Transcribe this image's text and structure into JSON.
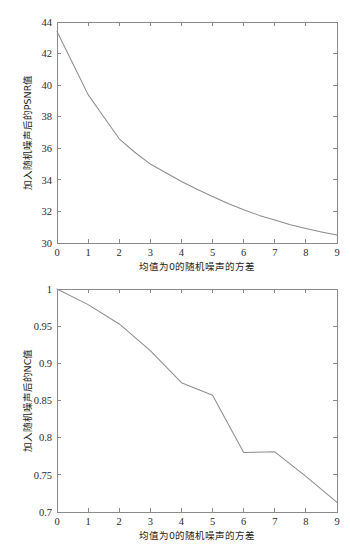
{
  "page": {
    "background_color": "#ffffff",
    "line_color": "#8d8d8d",
    "axis_color": "#8a8a8a",
    "text_color": "#2b2b2b"
  },
  "chart_data": [
    {
      "id": "psnr",
      "type": "line",
      "title": "",
      "xlabel": "均值为0的随机噪声的方差",
      "ylabel": "加入随机噪声后的PSNR值",
      "xlim": [
        0,
        9
      ],
      "ylim": [
        30,
        44
      ],
      "xticks": [
        0,
        1,
        2,
        3,
        4,
        5,
        6,
        7,
        8,
        9
      ],
      "xticklabels": [
        "0",
        "1",
        "2",
        "3",
        "4",
        "5",
        "6",
        "7",
        "8",
        "9"
      ],
      "yticks": [
        30,
        32,
        34,
        36,
        38,
        40,
        42,
        44
      ],
      "yticklabels": [
        "30",
        "32",
        "34",
        "36",
        "38",
        "40",
        "42",
        "44"
      ],
      "grid": false,
      "legend": "none",
      "x": [
        0,
        0.5,
        1,
        1.5,
        2,
        2.5,
        3,
        3.5,
        4,
        4.5,
        5,
        5.5,
        6,
        6.5,
        7,
        7.5,
        8,
        8.5,
        9
      ],
      "values": [
        43.4,
        41.4,
        39.4,
        38.0,
        36.6,
        35.75,
        35.0,
        34.45,
        33.9,
        33.4,
        32.95,
        32.5,
        32.1,
        31.75,
        31.45,
        31.15,
        30.92,
        30.7,
        30.5
      ]
    },
    {
      "id": "nc",
      "type": "line",
      "title": "",
      "xlabel": "均值为0的随机噪声的方差",
      "ylabel": "加入随机噪声后的NC值",
      "xlim": [
        0,
        9
      ],
      "ylim": [
        0.7,
        1
      ],
      "xticks": [
        0,
        1,
        2,
        3,
        4,
        5,
        6,
        7,
        8,
        9
      ],
      "xticklabels": [
        "0",
        "1",
        "2",
        "3",
        "4",
        "5",
        "6",
        "7",
        "8",
        "9"
      ],
      "yticks": [
        0.7,
        0.75,
        0.8,
        0.85,
        0.9,
        0.95,
        1
      ],
      "yticklabels": [
        "0.7",
        "0.75",
        "0.8",
        "0.85",
        "0.9",
        "0.95",
        "1"
      ],
      "grid": false,
      "legend": "none",
      "x": [
        0,
        1,
        2,
        3,
        4,
        5,
        6,
        7,
        8,
        9
      ],
      "values": [
        1.0,
        0.979,
        0.953,
        0.917,
        0.874,
        0.857,
        0.78,
        0.781,
        0.748,
        0.713
      ]
    }
  ]
}
